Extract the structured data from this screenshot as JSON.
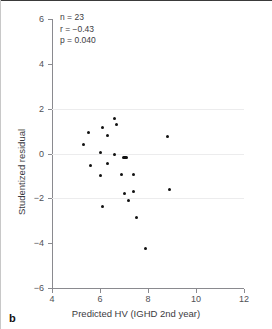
{
  "panel": {
    "label": "b"
  },
  "annotations": {
    "n": "n = 23",
    "r": "r = −0.43",
    "p": "p = 0.040"
  },
  "chart_data": {
    "type": "scatter",
    "title": "",
    "xlabel": "Predicted HV (IGHD 2nd year)",
    "ylabel": "Studentized residual",
    "xlim": [
      4,
      12
    ],
    "ylim": [
      -6,
      6
    ],
    "xticks": [
      "4",
      "6",
      "8",
      "10",
      "12"
    ],
    "yticks": [
      "6",
      "4",
      "2",
      "0",
      "−2",
      "−4",
      "−6"
    ],
    "xtick_values": [
      4,
      6,
      8,
      10,
      12
    ],
    "ytick_values": [
      6,
      4,
      2,
      0,
      -2,
      -4,
      -6
    ],
    "gridlines_y": [
      2,
      0,
      -2
    ],
    "grid": true,
    "legend": null,
    "n_points": 23,
    "correlation_r": -0.43,
    "p_value": 0.04,
    "points": [
      {
        "x": 5.5,
        "y": 0.95
      },
      {
        "x": 5.3,
        "y": 0.4
      },
      {
        "x": 5.6,
        "y": -0.55
      },
      {
        "x": 6.1,
        "y": 1.15
      },
      {
        "x": 6.3,
        "y": 0.82
      },
      {
        "x": 6.6,
        "y": 1.55
      },
      {
        "x": 6.7,
        "y": 1.28
      },
      {
        "x": 6.0,
        "y": 0.05
      },
      {
        "x": 6.3,
        "y": -0.45
      },
      {
        "x": 6.0,
        "y": -1.0
      },
      {
        "x": 6.1,
        "y": -2.35
      },
      {
        "x": 6.6,
        "y": -0.05
      },
      {
        "x": 7.0,
        "y": -0.2
      },
      {
        "x": 7.1,
        "y": -0.2
      },
      {
        "x": 6.9,
        "y": -0.95
      },
      {
        "x": 7.4,
        "y": -0.95
      },
      {
        "x": 7.0,
        "y": -1.8
      },
      {
        "x": 7.2,
        "y": -2.1
      },
      {
        "x": 7.4,
        "y": -1.7
      },
      {
        "x": 7.5,
        "y": -2.85
      },
      {
        "x": 7.9,
        "y": -4.25
      },
      {
        "x": 8.8,
        "y": 0.78
      },
      {
        "x": 8.9,
        "y": -1.6
      }
    ]
  }
}
